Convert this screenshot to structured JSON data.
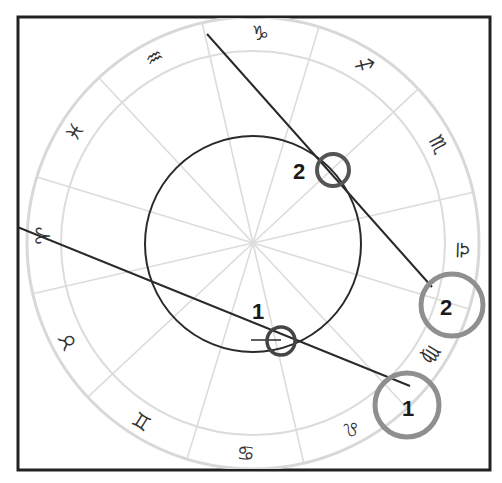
{
  "diagram": {
    "type": "zodiac-wheel",
    "colors": {
      "frame": "#222222",
      "wheel_lines": "#d6d6d6",
      "black_circle": "#2a2a2a",
      "axis_lines": "#2a2a2a",
      "small_markers": "#555555",
      "large_markers": "#8f8f8f",
      "glyphs": "#333333"
    },
    "signs": [
      {
        "name": "capricorn",
        "glyph": "♑",
        "angle": -88
      },
      {
        "name": "sagittarius",
        "glyph": "♐",
        "angle": -58
      },
      {
        "name": "scorpio",
        "glyph": "♏",
        "angle": -28
      },
      {
        "name": "libra",
        "glyph": "♎",
        "angle": 2
      },
      {
        "name": "virgo",
        "glyph": "♍",
        "angle": 32
      },
      {
        "name": "leo",
        "glyph": "♌",
        "angle": 62
      },
      {
        "name": "cancer",
        "glyph": "♋",
        "angle": 92
      },
      {
        "name": "gemini",
        "glyph": "♊",
        "angle": 122
      },
      {
        "name": "taurus",
        "glyph": "♉",
        "angle": 152
      },
      {
        "name": "aries",
        "glyph": "♈",
        "angle": 182
      },
      {
        "name": "pisces",
        "glyph": "♓",
        "angle": 212
      },
      {
        "name": "aquarius",
        "glyph": "♒",
        "angle": 242
      }
    ],
    "markers": {
      "small_1_label": "1",
      "small_2_label": "2",
      "large_1_label": "1",
      "large_2_label": "2"
    }
  }
}
